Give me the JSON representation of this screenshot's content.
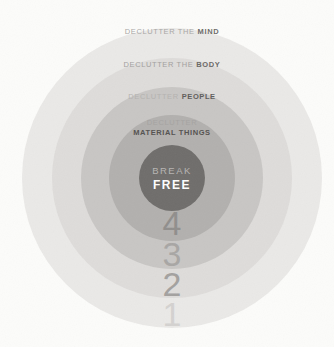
{
  "diagram": {
    "background_color": "#fcfcfa",
    "rings": [
      {
        "number": "1",
        "number_color": "#d4d2d0",
        "color": "#eae9e7",
        "label_light": "DECLUTTER THE",
        "label_bold": "MIND",
        "label_light_color": "#a9a7a5",
        "label_bold_color": "#6e6c6a"
      },
      {
        "number": "2",
        "number_color": "#a3a19f",
        "color": "#dedcda",
        "label_light": "DECLUTTER THE",
        "label_bold": "BODY",
        "label_light_color": "#a2a09e",
        "label_bold_color": "#6a6866"
      },
      {
        "number": "3",
        "number_color": "#a8a6a4",
        "color": "#c8c6c4",
        "label_light": "DECLUTTER",
        "label_bold": "PEOPLE",
        "label_light_color": "#b4b2b0",
        "label_bold_color": "#5f5d5b"
      },
      {
        "number": "4",
        "number_color": "#908e8c",
        "color": "#b2b0ae",
        "label_light": "DECLUTTER",
        "label_bold": "MATERIAL THINGS",
        "label_light_color": "#a5a3a1",
        "label_bold_color": "#545250"
      }
    ],
    "center": {
      "word1": "BREAK",
      "word2": "FREE",
      "color": "#6f6d6b",
      "word1_color": "#b7b5b3",
      "word2_color": "#fefefe"
    }
  }
}
